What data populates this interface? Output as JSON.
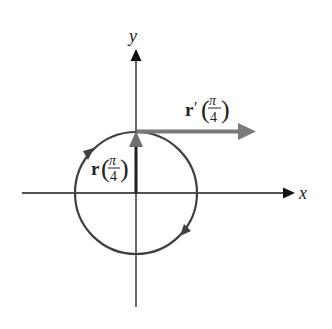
{
  "figure": {
    "axes": {
      "x_label": "x",
      "y_label": "y",
      "origin": [
        136,
        193
      ],
      "color": "#1a1a1a"
    },
    "circle": {
      "center": [
        136,
        193
      ],
      "radius": 61,
      "color": "#404040",
      "direction": "clockwise"
    },
    "vectors": {
      "position": {
        "symbol": "r",
        "argument_numerator": "π",
        "argument_denominator": "4",
        "color": "#1f1f1f",
        "head_color": "#6e6e6e"
      },
      "derivative": {
        "symbol": "r",
        "prime": "′",
        "argument_numerator": "π",
        "argument_denominator": "4",
        "color": "#7a7a7a"
      }
    }
  }
}
